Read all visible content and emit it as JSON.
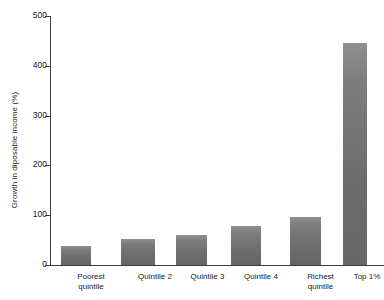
{
  "chart_data": {
    "type": "bar",
    "title": "",
    "subtitle": "",
    "xlabel": "",
    "ylabel": "Growth in diposable income (%)",
    "categories": [
      "Poorest\nquintile",
      "Quintile 2",
      "Quintile 3",
      "Quintile 4",
      "Richest\nquintile",
      "Top 1%"
    ],
    "values": [
      38,
      52,
      60,
      78,
      97,
      446
    ],
    "ylim": [
      0,
      500
    ],
    "yticks": [
      0,
      100,
      200,
      300,
      400,
      500
    ],
    "ytick_labels": [
      "0",
      "100",
      "200",
      "300",
      "400",
      "500"
    ],
    "grid": false,
    "legend": "none",
    "bar_color": "#6d6d6d",
    "axis_color": "#3d3d3d",
    "background_color": "#ffffff"
  },
  "axes": {
    "y_title": "Growth in diposable income (%)"
  }
}
